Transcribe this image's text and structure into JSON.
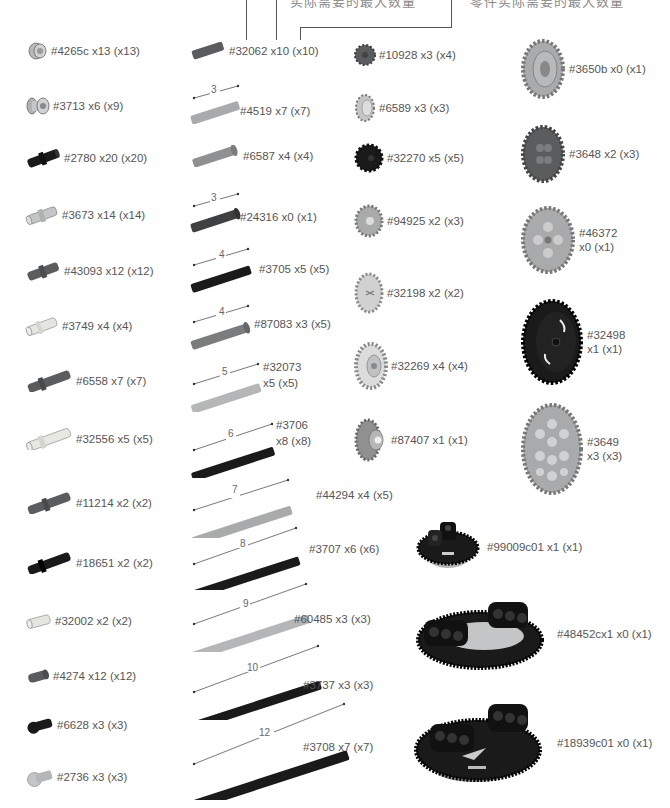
{
  "header": {
    "annotation_left": "实际需要的最大数量",
    "annotation_right": "零件实际需要的最大数量"
  },
  "colors": {
    "black_part": "#1a1a1a",
    "dark_gray_part": "#5a5c5e",
    "light_gray_part": "#a8aaab",
    "tan_part": "#d8d8d0",
    "text": "#555555",
    "line": "#555555"
  },
  "columns": {
    "pins": [
      {
        "part": "#4265c",
        "qty": "x13",
        "max": "(x13)",
        "label": "#4265c x13 (x13)",
        "icon": "bush-icon",
        "color": "light"
      },
      {
        "part": "#3713",
        "qty": "x6",
        "max": "(x9)",
        "label": "#3713 x6 (x9)",
        "icon": "bush-icon",
        "color": "light"
      },
      {
        "part": "#2780",
        "qty": "x20",
        "max": "(x20)",
        "label": "#2780 x20 (x20)",
        "icon": "pin-icon",
        "color": "black"
      },
      {
        "part": "#3673",
        "qty": "x14",
        "max": "(x14)",
        "label": "#3673 x14 (x14)",
        "icon": "pin-icon",
        "color": "light"
      },
      {
        "part": "#43093",
        "qty": "x12",
        "max": "(x12)",
        "label": "#43093 x12 (x12)",
        "icon": "axle-pin-icon",
        "color": "dark"
      },
      {
        "part": "#3749",
        "qty": "x4",
        "max": "(x4)",
        "label": "#3749 x4 (x4)",
        "icon": "axle-pin-icon",
        "color": "tan"
      },
      {
        "part": "#6558",
        "qty": "x7",
        "max": "(x7)",
        "label": "#6558 x7 (x7)",
        "icon": "long-pin-icon",
        "color": "dark"
      },
      {
        "part": "#32556",
        "qty": "x5",
        "max": "(x5)",
        "label": "#32556 x5 (x5)",
        "icon": "long-pin-icon",
        "color": "tan"
      },
      {
        "part": "#11214",
        "qty": "x2",
        "max": "(x2)",
        "label": "#11214 x2 (x2)",
        "icon": "long-axle-pin-icon",
        "color": "dark"
      },
      {
        "part": "#18651",
        "qty": "x2",
        "max": "(x2)",
        "label": "#18651 x2 (x2)",
        "icon": "long-axle-pin-icon",
        "color": "black"
      },
      {
        "part": "#32002",
        "qty": "x2",
        "max": "(x2)",
        "label": "#32002 x2 (x2)",
        "icon": "pin-icon",
        "color": "tan"
      },
      {
        "part": "#4274",
        "qty": "x12",
        "max": "(x12)",
        "label": "#4274 x12 (x12)",
        "icon": "half-pin-icon",
        "color": "dark"
      },
      {
        "part": "#6628",
        "qty": "x3",
        "max": "(x3)",
        "label": "#6628 x3 (x3)",
        "icon": "towball-pin-icon",
        "color": "black"
      },
      {
        "part": "#2736",
        "qty": "x3",
        "max": "(x3)",
        "label": "#2736 x3 (x3)",
        "icon": "towball-axle-icon",
        "color": "light"
      }
    ],
    "axles": [
      {
        "part": "#32062",
        "label": "#32062 x10 (x10)",
        "length": "",
        "color": "dark"
      },
      {
        "part": "#4519",
        "label": "#4519 x7 (x7)",
        "length": "3",
        "color": "light"
      },
      {
        "part": "#6587",
        "label": "#6587 x4 (x4)",
        "length": "",
        "color": "dark"
      },
      {
        "part": "#24316",
        "label": "#24316 x0 (x1)",
        "length": "3",
        "color": "dark"
      },
      {
        "part": "#3705",
        "label": "#3705 x5 (x5)",
        "length": "4",
        "color": "black"
      },
      {
        "part": "#87083",
        "label": "#87083 x3 (x5)",
        "length": "4",
        "color": "dark"
      },
      {
        "part": "#32073",
        "label_line1": "#32073",
        "label_line2": "x5 (x5)",
        "length": "5",
        "color": "light"
      },
      {
        "part": "#3706",
        "label_line1": "#3706",
        "label_line2": "x8 (x8)",
        "length": "6",
        "color": "black"
      },
      {
        "part": "#44294",
        "label": "#44294 x4 (x5)",
        "length": "7",
        "color": "light"
      },
      {
        "part": "#3707",
        "label": "#3707 x6 (x6)",
        "length": "8",
        "color": "black"
      },
      {
        "part": "#60485",
        "label": "#60485 x3 (x3)",
        "length": "9",
        "color": "light"
      },
      {
        "part": "#3737",
        "label": "#3737 x3 (x3)",
        "length": "10",
        "color": "black"
      },
      {
        "part": "#3708",
        "label": "#3708 x7 (x7)",
        "length": "12",
        "color": "black"
      }
    ],
    "small_gears": [
      {
        "part": "#10928",
        "label": "#10928 x3 (x4)",
        "color": "dark"
      },
      {
        "part": "#6589",
        "label": "#6589 x3 (x3)",
        "color": "light"
      },
      {
        "part": "#32270",
        "label": "#32270 x5 (x5)",
        "color": "black"
      },
      {
        "part": "#94925",
        "label": "#94925 x2 (x3)",
        "color": "light"
      },
      {
        "part": "#32198",
        "label": "#32198 x2 (x2)",
        "color": "light"
      },
      {
        "part": "#32269",
        "label": "#32269 x4 (x4)",
        "color": "light"
      },
      {
        "part": "#87407",
        "label": "#87407 x1 (x1)",
        "color": "dark"
      }
    ],
    "large_gears": [
      {
        "part": "#3650b",
        "label": "#3650b x0 (x1)",
        "color": "light"
      },
      {
        "part": "#3648",
        "label": "#3648 x2 (x3)",
        "color": "dark"
      },
      {
        "part": "#46372",
        "label_line1": "#46372",
        "label_line2": "x0 (x1)",
        "color": "light"
      },
      {
        "part": "#32498",
        "label_line1": "#32498",
        "label_line2": "x1 (x1)",
        "color": "black"
      },
      {
        "part": "#3649",
        "label_line1": "#3649",
        "label_line2": "x3 (x3)",
        "color": "light"
      }
    ],
    "turntables": [
      {
        "part": "#99009c01",
        "label": "#99009c01 x1 (x1)"
      },
      {
        "part": "#48452cx1",
        "label": "#48452cx1 x0 (x1)"
      },
      {
        "part": "#18939c01",
        "label": "#18939c01 x0 (x1)"
      }
    ]
  }
}
